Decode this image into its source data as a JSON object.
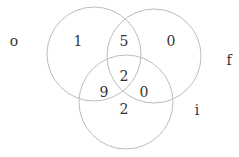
{
  "diagram": {
    "type": "venn-3",
    "sets": [
      {
        "name": "o",
        "cx": 94,
        "cy": 54,
        "r": 47,
        "label_x": 14,
        "label_y": 41
      },
      {
        "name": "f",
        "cx": 154,
        "cy": 56,
        "r": 47,
        "label_x": 229,
        "label_y": 60
      },
      {
        "name": "i",
        "cx": 126,
        "cy": 102,
        "r": 47,
        "label_x": 197,
        "label_y": 110
      }
    ],
    "regions": [
      {
        "id": "o_only",
        "value": "1",
        "x": 78,
        "y": 41
      },
      {
        "id": "o_f",
        "value": "5",
        "x": 124,
        "y": 41
      },
      {
        "id": "f_only",
        "value": "0",
        "x": 171,
        "y": 41
      },
      {
        "id": "o_f_i",
        "value": "2",
        "x": 124,
        "y": 76
      },
      {
        "id": "o_i",
        "value": "9",
        "x": 104,
        "y": 92
      },
      {
        "id": "f_i",
        "value": "0",
        "x": 144,
        "y": 92
      },
      {
        "id": "i_only",
        "value": "2",
        "x": 124,
        "y": 109
      }
    ],
    "stroke_color": "#bdbdbd",
    "text_color": "#333333"
  }
}
